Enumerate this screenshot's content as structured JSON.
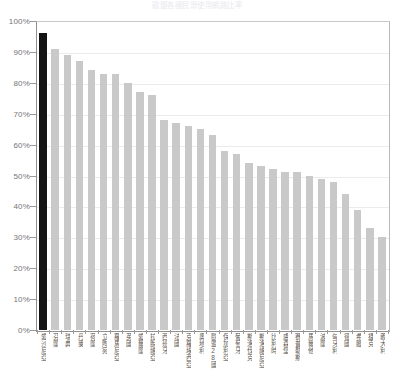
{
  "chart_data": {
    "type": "bar",
    "title": "歐盟各國民眾使用網路比率",
    "xlabel": "",
    "ylabel": "",
    "ylim": [
      0,
      100
    ],
    "yticks": [
      "0%",
      "10%",
      "20%",
      "30%",
      "40%",
      "50%",
      "60%",
      "70%",
      "80%",
      "90%",
      "100%"
    ],
    "grid": true,
    "legend": "none",
    "unit": "%",
    "highlight_index": 0,
    "colors": {
      "bar": "#c9c9c9",
      "highlight": "#141414",
      "grid": "#ebebeb",
      "axis": "#8f8f8f",
      "tick_label": "#757575",
      "category_label": "#5d5d5d",
      "background": "#ffffff"
    },
    "categories": [
      "愛沙尼亞",
      "芬蘭",
      "瑞典",
      "丹麥",
      "荷蘭",
      "立陶宛",
      "羅馬尼亞",
      "英國",
      "愛爾蘭",
      "拉脫維亞",
      "西班牙",
      "法國",
      "克羅埃西亞",
      "奧地利",
      "歐盟28國",
      "保加利亞",
      "葡萄牙",
      "斯洛伐克",
      "斯洛維尼亞",
      "比利時",
      "盧森堡",
      "賽普勒斯",
      "馬爾他",
      "波蘭",
      "匈牙利",
      "德國",
      "希臘",
      "捷克",
      "義大利"
    ],
    "values": [
      96,
      91,
      89,
      87,
      84,
      83,
      83,
      80,
      77,
      76,
      68,
      67,
      66,
      65,
      63,
      58,
      57,
      54,
      53,
      52,
      51,
      51,
      50,
      49,
      48,
      44,
      39,
      33,
      30
    ]
  }
}
